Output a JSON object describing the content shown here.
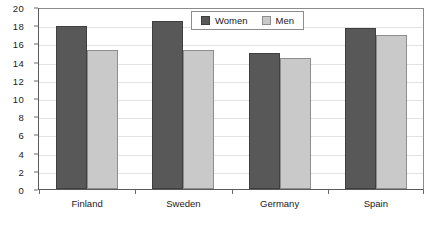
{
  "chart_data": {
    "type": "bar",
    "title": "",
    "subtitle": "",
    "xlabel": "",
    "ylabel": "",
    "categories": [
      "Finland",
      "Sweden",
      "Germany",
      "Spain"
    ],
    "series": [
      {
        "name": "Women",
        "color": "#585858",
        "values": [
          17.9,
          18.5,
          15.0,
          17.7
        ]
      },
      {
        "name": "Men",
        "color": "#c9c9c9",
        "values": [
          15.3,
          15.3,
          14.4,
          16.9
        ]
      }
    ],
    "ylim": [
      0,
      20
    ],
    "ytick_step": 2,
    "ytick_labels": [
      "0",
      "2",
      "4",
      "6",
      "8",
      "10",
      "12",
      "14",
      "16",
      "18",
      "20"
    ],
    "grid": "horizontal",
    "legend_position": "top-center",
    "annotations": []
  },
  "legend": {
    "entries": [
      {
        "label": "Women",
        "swatch": "women-swatch"
      },
      {
        "label": "Men",
        "swatch": "men-swatch"
      }
    ]
  }
}
